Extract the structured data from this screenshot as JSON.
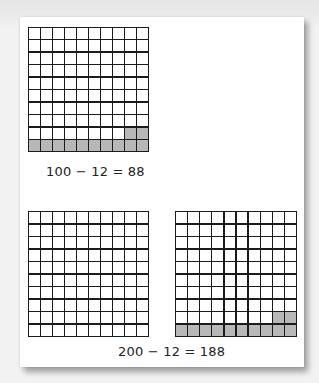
{
  "figure": {
    "top_section": {
      "grid": {
        "rows": 10,
        "cols": 10,
        "shaded_cells": 12,
        "shaded_description": "bottom row (10 cells) plus the last 2 cells of row 9"
      },
      "equation": "100 − 12 = 88"
    },
    "bottom_section": {
      "grids": [
        {
          "rows": 10,
          "cols": 10,
          "shaded_cells": 0
        },
        {
          "rows": 10,
          "cols": 10,
          "shaded_cells": 12,
          "shaded_description": "bottom row (10 cells) plus the last 2 cells of row 9"
        }
      ],
      "equation": "200 − 12 = 188"
    },
    "colors": {
      "grid_line": "#1a1a1a",
      "shaded": "#b8b8b8",
      "unshaded": "#ffffff",
      "card": "#ffffff"
    }
  }
}
